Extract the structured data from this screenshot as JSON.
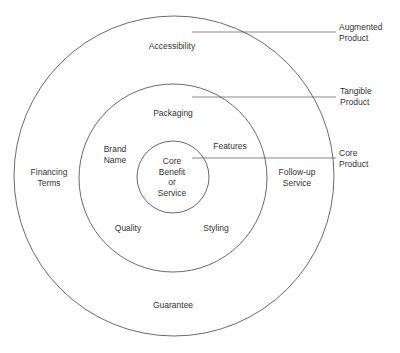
{
  "diagram": {
    "type": "concentric-circles",
    "levels": [
      {
        "name": "core",
        "label": "Core\nProduct",
        "items": [
          "Core\nBenefit\nor\nService"
        ]
      },
      {
        "name": "tangible",
        "label": "Tangible\nProduct",
        "items": [
          "Packaging",
          "Brand\nName",
          "Features",
          "Quality",
          "Styling"
        ]
      },
      {
        "name": "augmented",
        "label": "Augmented\nProduct",
        "items": [
          "Accessibility",
          "Financing\nTerms",
          "Follow-up\nService",
          "Guarantee"
        ]
      }
    ]
  },
  "labels": {
    "core_benefit": "Core\nBenefit\nor\nService",
    "packaging": "Packaging",
    "brand_name": "Brand\nName",
    "features": "Features",
    "quality": "Quality",
    "styling": "Styling",
    "accessibility": "Accessibility",
    "financing_terms": "Financing\nTerms",
    "followup_service": "Follow-up\nService",
    "guarantee": "Guarantee",
    "augmented_product": "Augmented\nProduct",
    "tangible_product": "Tangible\nProduct",
    "core_product": "Core\nProduct"
  },
  "colors": {
    "line": "#444444",
    "text": "#333333",
    "background": "#ffffff"
  }
}
